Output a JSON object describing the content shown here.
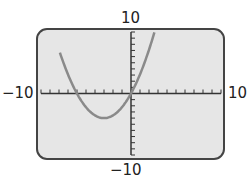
{
  "labels": {
    "ymax": "10",
    "ymin": "−10",
    "xmin": "−10",
    "xmax": "10"
  },
  "chart_data": {
    "type": "line",
    "title": "",
    "xlabel": "",
    "ylabel": "",
    "xlim": [
      -10,
      10
    ],
    "ylim": [
      -10,
      10
    ],
    "grid": false,
    "xscale_ticks": 1,
    "yscale_ticks": 1,
    "series": [
      {
        "name": "parabola",
        "x": [
          -8,
          -7,
          -6,
          -5,
          -4,
          -3,
          -2,
          -1,
          0,
          1,
          2,
          3
        ],
        "y": [
          10.0,
          3.1,
          0,
          -2.2,
          -3.6,
          -4.0,
          -3.6,
          -2.2,
          0,
          3.1,
          7.1,
          12.0
        ]
      }
    ],
    "colors": {
      "screen": "#e6e6e6",
      "border": "#444444",
      "curve": "#8a8a8a",
      "axis": "#333333"
    }
  }
}
